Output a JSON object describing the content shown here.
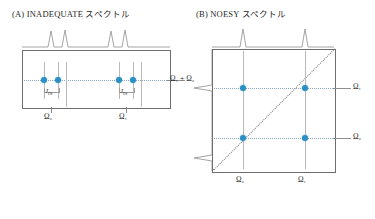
{
  "panels": [
    {
      "key": "a",
      "title": "(A) INADEQUATE スペクトル",
      "vertical_axis_label": "Ω₁ + Ω₂",
      "bottom_labels": [
        "Ω₂",
        "Ω₁"
      ],
      "coupling_labels": [
        "J",
        "J"
      ],
      "coupling_subscript": "IS",
      "peak_count": 4,
      "dot_count": 4,
      "accent_color": "#2b8fc4",
      "line_color": "#8f8f8f",
      "box_color": "#6e6e6e"
    },
    {
      "key": "b",
      "title": "(B) NOESY スペクトル",
      "right_labels": [
        "Ω₁",
        "Ω₂"
      ],
      "bottom_labels": [
        "Ω₂",
        "Ω₁"
      ],
      "peak_count_top": 2,
      "peak_count_left": 2,
      "dot_count": 4,
      "has_diagonal": true,
      "accent_color": "#2b8fc4",
      "line_color": "#8f8f8f",
      "box_color": "#6e6e6e"
    }
  ]
}
